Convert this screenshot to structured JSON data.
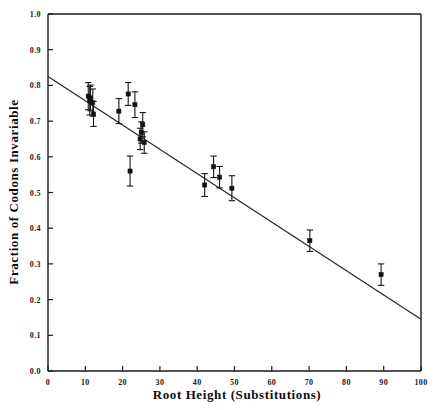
{
  "chart_data": {
    "type": "scatter",
    "title": "",
    "xlabel": "Root Height (Substitutions)",
    "ylabel": "Fraction of Codons Invariable",
    "xlim": [
      0,
      100
    ],
    "ylim": [
      0.0,
      1.0
    ],
    "grid": false,
    "legend": "none",
    "xticks": [
      0,
      10,
      20,
      30,
      40,
      50,
      60,
      70,
      80,
      90,
      100
    ],
    "xtick_labels": [
      "0",
      "10",
      "20",
      "30",
      "40",
      "50",
      "60",
      "70",
      "80",
      "90",
      "100"
    ],
    "yticks": [
      0.0,
      0.1,
      0.2,
      0.3,
      0.4,
      0.5,
      0.6,
      0.7,
      0.8,
      0.9,
      1.0
    ],
    "ytick_labels": [
      "0.0",
      "0.1",
      "0.2",
      "0.3",
      "0.4",
      "0.5",
      "0.6",
      "0.7",
      "0.8",
      "0.9",
      "1.0"
    ],
    "marker": "filled-square",
    "marker_color": "#111111",
    "line_color": "#2b2b2b",
    "points": [
      {
        "x": 10.8,
        "y": 0.77,
        "yerr": 0.038
      },
      {
        "x": 11.4,
        "y": 0.765,
        "yerr": 0.036
      },
      {
        "x": 11.2,
        "y": 0.757,
        "yerr": 0.04
      },
      {
        "x": 12.0,
        "y": 0.752,
        "yerr": 0.038
      },
      {
        "x": 12.2,
        "y": 0.72,
        "yerr": 0.035
      },
      {
        "x": 19.0,
        "y": 0.728,
        "yerr": 0.035
      },
      {
        "x": 21.5,
        "y": 0.776,
        "yerr": 0.032
      },
      {
        "x": 23.3,
        "y": 0.746,
        "yerr": 0.036
      },
      {
        "x": 22.0,
        "y": 0.56,
        "yerr": 0.042
      },
      {
        "x": 25.4,
        "y": 0.69,
        "yerr": 0.034
      },
      {
        "x": 25.0,
        "y": 0.668,
        "yerr": 0.03
      },
      {
        "x": 24.7,
        "y": 0.65,
        "yerr": 0.03
      },
      {
        "x": 25.8,
        "y": 0.64,
        "yerr": 0.03
      },
      {
        "x": 42.0,
        "y": 0.521,
        "yerr": 0.032
      },
      {
        "x": 44.4,
        "y": 0.572,
        "yerr": 0.03
      },
      {
        "x": 46.0,
        "y": 0.543,
        "yerr": 0.03
      },
      {
        "x": 49.3,
        "y": 0.512,
        "yerr": 0.035
      },
      {
        "x": 70.2,
        "y": 0.365,
        "yerr": 0.03
      },
      {
        "x": 89.3,
        "y": 0.27,
        "yerr": 0.03
      }
    ],
    "fit_line": {
      "x0": 0,
      "y0": 0.825,
      "x1": 100,
      "y1": 0.145
    }
  }
}
